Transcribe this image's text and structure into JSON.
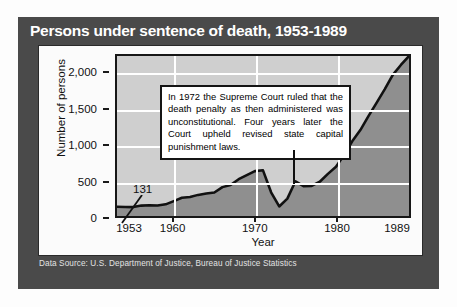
{
  "title": "Persons under sentence of death, 1953-1989",
  "source_note": "Data Source: U.S. Department of Justice, Bureau of Justice Statistics",
  "annotations": {
    "callout_text": "In 1972 the Supreme Court ruled that the death penalty as then administered was unconstitutional. Four years later the Court upheld revised state capital punishment laws.",
    "point_label": "131"
  },
  "colors": {
    "panel": "#4a4a4a",
    "card": "#fbfbfb",
    "plot_background": "#cfcfcf",
    "area_fill": "#8f8f8f",
    "line": "#111111",
    "gridline": "#ffffff",
    "title_text": "#ffffff"
  },
  "chart_data": {
    "type": "area",
    "title": "Persons under sentence of death, 1953-1989",
    "xlabel": "Year",
    "ylabel": "Number of persons",
    "xlim": [
      1953,
      1989
    ],
    "ylim": [
      0,
      2250
    ],
    "grid": true,
    "legend": "none",
    "ytick_labels": [
      "0",
      "500",
      "1,000",
      "1,500",
      "2,000"
    ],
    "ytick_values": [
      0,
      500,
      1000,
      1500,
      2000
    ],
    "xtick_labels": [
      "1953",
      "1960",
      "1970",
      "1980",
      "1989"
    ],
    "xtick_values": [
      1953,
      1960,
      1970,
      1980,
      1989
    ],
    "x": [
      1953,
      1954,
      1955,
      1956,
      1957,
      1958,
      1959,
      1960,
      1961,
      1962,
      1963,
      1964,
      1965,
      1966,
      1967,
      1968,
      1969,
      1970,
      1971,
      1972,
      1973,
      1974,
      1975,
      1976,
      1977,
      1978,
      1979,
      1980,
      1981,
      1982,
      1983,
      1984,
      1985,
      1986,
      1987,
      1988,
      1989
    ],
    "values": [
      131,
      127,
      125,
      146,
      151,
      147,
      164,
      210,
      257,
      267,
      297,
      315,
      331,
      406,
      435,
      517,
      575,
      631,
      642,
      334,
      134,
      244,
      488,
      420,
      423,
      482,
      593,
      692,
      860,
      1050,
      1209,
      1405,
      1591,
      1781,
      1984,
      2124,
      2250
    ],
    "annotations": [
      {
        "x": 1953,
        "y": 131,
        "label": "131"
      },
      {
        "x": 1972,
        "label": "In 1972 the Supreme Court ruled that the death penalty as then administered was unconstitutional. Four years later the Court upheld revised state capital punishment laws."
      }
    ]
  }
}
